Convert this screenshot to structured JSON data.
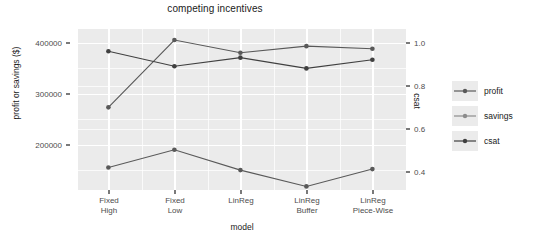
{
  "chart_data": {
    "type": "line",
    "title": "competing incentives",
    "xlabel": "model",
    "ylabel": "profit or savings ($)",
    "y2label": "csat",
    "categories": [
      "Fixed\nHigh",
      "Fixed\nLow",
      "LinReg",
      "LinReg\nBuffer",
      "LinReg\nPiece-Wise"
    ],
    "grid": true,
    "legend_position": "right",
    "ylim": [
      118000,
      420000
    ],
    "yticks": [
      200000,
      300000,
      400000
    ],
    "ytick_labels": [
      "200000",
      "300000",
      "400000"
    ],
    "y2lim": [
      0.27,
      1.02
    ],
    "y2ticks": [
      0.4,
      0.6,
      0.8,
      1.0
    ],
    "y2tick_labels": [
      "0.4",
      "0.6",
      "0.8",
      "1.0"
    ],
    "series": [
      {
        "name": "profit",
        "axis": "left",
        "color": "#595959",
        "values": [
          155000,
          190000,
          150000,
          118000,
          152000
        ]
      },
      {
        "name": "savings",
        "axis": "left",
        "color": "#595959",
        "values": [
          273000,
          405000,
          380000,
          393000,
          388000
        ]
      },
      {
        "name": "csat",
        "axis": "right",
        "color": "#404040",
        "values": [
          0.96,
          0.89,
          0.93,
          0.88,
          0.92
        ]
      }
    ]
  },
  "legend": {
    "items": [
      {
        "label": "profit"
      },
      {
        "label": "savings"
      },
      {
        "label": "csat"
      }
    ]
  },
  "theme": {
    "panel_background": "#ebebeb",
    "grid_color": "#ffffff",
    "text_color": "#1a1a1a",
    "tick_color": "#4d4d4d"
  }
}
